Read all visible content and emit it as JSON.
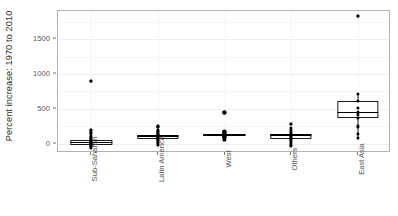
{
  "chart_data": {
    "type": "box",
    "title": "",
    "xlabel": "",
    "ylabel": "Percent increase: 1970 to 2010",
    "ylim": [
      -130,
      1900
    ],
    "yticks": [
      0,
      500,
      1000,
      1500
    ],
    "ytick_labels": [
      "0",
      "500",
      "1000",
      "1500"
    ],
    "grid": true,
    "legend": "none",
    "categories": [
      "Sub-Saharan",
      "Latin America",
      "West",
      "Others",
      "East Asia"
    ],
    "boxes": [
      {
        "category": "Sub-Saharan",
        "min": -60,
        "q1": -10,
        "median": 20,
        "q3": 60,
        "max": 130,
        "outliers": [
          200,
          900
        ],
        "points": [
          -60,
          -45,
          -30,
          -20,
          -10,
          0,
          5,
          10,
          15,
          20,
          25,
          30,
          40,
          55,
          70,
          85,
          100,
          120,
          150,
          175,
          200,
          900
        ]
      },
      {
        "category": "Latin America",
        "min": -10,
        "q1": 70,
        "median": 110,
        "q3": 130,
        "max": 200,
        "outliers": [
          250
        ],
        "points": [
          -10,
          10,
          30,
          45,
          60,
          70,
          80,
          90,
          100,
          110,
          115,
          120,
          125,
          130,
          140,
          155,
          170,
          185,
          200,
          250
        ]
      },
      {
        "category": "West",
        "min": 60,
        "q1": 110,
        "median": 130,
        "q3": 145,
        "max": 190,
        "outliers": [
          450
        ],
        "points": [
          60,
          80,
          95,
          105,
          110,
          120,
          125,
          130,
          135,
          140,
          145,
          155,
          165,
          175,
          190,
          450
        ]
      },
      {
        "category": "Others",
        "min": -30,
        "q1": 75,
        "median": 125,
        "q3": 145,
        "max": 230,
        "outliers": [
          290
        ],
        "points": [
          -30,
          -10,
          15,
          40,
          60,
          75,
          90,
          105,
          115,
          125,
          135,
          145,
          160,
          180,
          200,
          230,
          290
        ]
      },
      {
        "category": "East Asia",
        "min": 80,
        "q1": 370,
        "median": 450,
        "q3": 620,
        "max": 710,
        "outliers": [
          1830
        ],
        "points": [
          80,
          140,
          250,
          370,
          420,
          450,
          520,
          620,
          710,
          1830
        ]
      }
    ]
  },
  "axes": {
    "y_title": "Percent increase: 1970 to 2010",
    "y_tick_0": "0",
    "y_tick_500": "500",
    "y_tick_1000": "1000",
    "y_tick_1500": "1500",
    "x_tick_0": "Sub-Saharan",
    "x_tick_1": "Latin America",
    "x_tick_2": "West",
    "x_tick_3": "Others",
    "x_tick_4": "East Asia"
  },
  "style": {
    "point_color": "#000000",
    "box_line_color": "#1a1a1a",
    "box_fill": "#ffffff",
    "panel_border": "#b3b3b3",
    "grid_color": "#eeeeee",
    "tick_text_color": "#575757",
    "title_text_color": "#2b2b2b"
  }
}
